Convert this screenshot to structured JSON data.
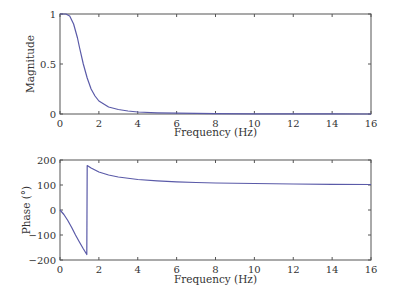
{
  "chart_data": [
    {
      "type": "line",
      "title": "",
      "xlabel": "Frequency (Hz)",
      "ylabel": "Magnitude",
      "xlim": [
        0,
        16
      ],
      "ylim": [
        0,
        1
      ],
      "xticks": [
        0,
        2,
        4,
        6,
        8,
        10,
        12,
        14,
        16
      ],
      "xtick_labels": [
        "0",
        "2",
        "4",
        "6",
        "8",
        "10",
        "12",
        "14",
        "16"
      ],
      "yticks": [
        0,
        0.5,
        1
      ],
      "ytick_labels": [
        "0",
        "0.5",
        "1"
      ],
      "grid": false,
      "legend": null,
      "series": [
        {
          "name": "Magnitude",
          "color": "#5a5aa8",
          "x": [
            0,
            0.3,
            0.5,
            0.7,
            0.9,
            1.0,
            1.2,
            1.4,
            1.6,
            1.8,
            2.0,
            2.5,
            3.0,
            3.5,
            4.0,
            5.0,
            6.0,
            8.0,
            10.0,
            12.0,
            14.0,
            16.0
          ],
          "y": [
            1.0,
            1.0,
            0.98,
            0.9,
            0.76,
            0.67,
            0.5,
            0.36,
            0.25,
            0.18,
            0.13,
            0.07,
            0.045,
            0.03,
            0.02,
            0.012,
            0.008,
            0.004,
            0.002,
            0.001,
            0.001,
            0.0
          ]
        }
      ]
    },
    {
      "type": "line",
      "title": "",
      "xlabel": "Frequency (Hz)",
      "ylabel": "Phase (°)",
      "xlim": [
        0,
        16
      ],
      "ylim": [
        -200,
        200
      ],
      "xticks": [
        0,
        2,
        4,
        6,
        8,
        10,
        12,
        14,
        16
      ],
      "xtick_labels": [
        "0",
        "2",
        "4",
        "6",
        "8",
        "10",
        "12",
        "14",
        "16"
      ],
      "yticks": [
        -200,
        -100,
        0,
        100,
        200
      ],
      "ytick_labels": [
        "−200",
        "−100",
        "0",
        "100",
        "200"
      ],
      "grid": false,
      "legend": null,
      "series": [
        {
          "name": "Phase",
          "color": "#5a5aa8",
          "x": [
            0,
            0.2,
            0.4,
            0.6,
            0.8,
            1.0,
            1.2,
            1.38,
            1.4,
            1.6,
            2.0,
            2.5,
            3.0,
            4.0,
            5.0,
            6.0,
            7.0,
            8.0,
            10.0,
            12.0,
            14.0,
            16.0
          ],
          "y": [
            0,
            -18,
            -42,
            -70,
            -100,
            -128,
            -155,
            -178,
            178,
            168,
            152,
            140,
            132,
            122,
            117,
            113,
            110,
            108,
            106,
            104,
            103,
            102
          ]
        }
      ]
    }
  ],
  "plots": {
    "top": {
      "ylabel": "Magnitude",
      "xlabel": "Frequency (Hz)"
    },
    "bottom": {
      "ylabel": "Phase (°)",
      "xlabel": "Frequency (Hz)"
    }
  }
}
